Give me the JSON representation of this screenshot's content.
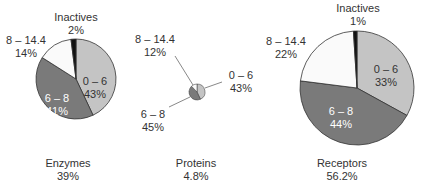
{
  "chart_data": [
    {
      "type": "pie",
      "title": "Enzymes",
      "share": "39%",
      "slices": [
        {
          "label": "0 – 6",
          "value": 43,
          "text": "43%",
          "color": "#c4c4c4"
        },
        {
          "label": "6 – 8",
          "value": 41,
          "text": "41%",
          "color": "#7a7a7a"
        },
        {
          "label": "8 – 14.4",
          "value": 14,
          "text": "14%",
          "color": "#fafafa"
        },
        {
          "label": "Inactives",
          "value": 2,
          "text": "2%",
          "color": "#111111"
        }
      ]
    },
    {
      "type": "pie",
      "title": "Proteins",
      "share": "4.8%",
      "slices": [
        {
          "label": "0 – 6",
          "value": 43,
          "text": "43%",
          "color": "#c4c4c4"
        },
        {
          "label": "6 – 8",
          "value": 45,
          "text": "45%",
          "color": "#7a7a7a"
        },
        {
          "label": "8 – 14.4",
          "value": 12,
          "text": "12%",
          "color": "#fafafa"
        }
      ]
    },
    {
      "type": "pie",
      "title": "Receptors",
      "share": "56.2%",
      "slices": [
        {
          "label": "0 – 6",
          "value": 33,
          "text": "33%",
          "color": "#c4c4c4"
        },
        {
          "label": "6 – 8",
          "value": 44,
          "text": "44%",
          "color": "#7a7a7a"
        },
        {
          "label": "8 – 14.4",
          "value": 22,
          "text": "22%",
          "color": "#fafafa"
        },
        {
          "label": "Inactives",
          "value": 1,
          "text": "1%",
          "color": "#111111"
        }
      ]
    }
  ],
  "pies": {
    "enzymes": {
      "title": "Enzymes",
      "share": "39%",
      "s0_label": "0 – 6",
      "s0_pct": "43%",
      "s1_label": "6 – 8",
      "s1_pct": "41%",
      "s2_label": "8 – 14.4",
      "s2_pct": "14%",
      "s3_label": "Inactives",
      "s3_pct": "2%"
    },
    "proteins": {
      "title": "Proteins",
      "share": "4.8%",
      "s0_label": "0 – 6",
      "s0_pct": "43%",
      "s1_label": "6 – 8",
      "s1_pct": "45%",
      "s2_label": "8 – 14.4",
      "s2_pct": "12%"
    },
    "receptors": {
      "title": "Receptors",
      "share": "56.2%",
      "s0_label": "0 – 6",
      "s0_pct": "33%",
      "s1_label": "6 – 8",
      "s1_pct": "44%",
      "s2_label": "8 – 14.4",
      "s2_pct": "22%",
      "s3_label": "Inactives",
      "s3_pct": "1%"
    }
  }
}
